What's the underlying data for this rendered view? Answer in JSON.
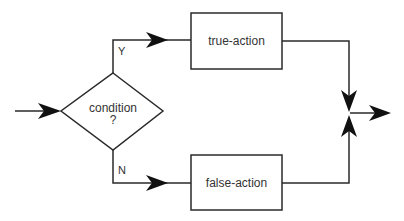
{
  "diagram": {
    "type": "flowchart",
    "title": "",
    "nodes": {
      "decision": {
        "label_line1": "condition",
        "label_line2": "?"
      },
      "true_action": {
        "label": "true-action"
      },
      "false_action": {
        "label": "false-action"
      }
    },
    "edges": {
      "yes": {
        "label": "Y"
      },
      "no": {
        "label": "N"
      }
    },
    "colors": {
      "line": "#2a2a2a",
      "text": "#333333",
      "background": "#ffffff"
    }
  }
}
